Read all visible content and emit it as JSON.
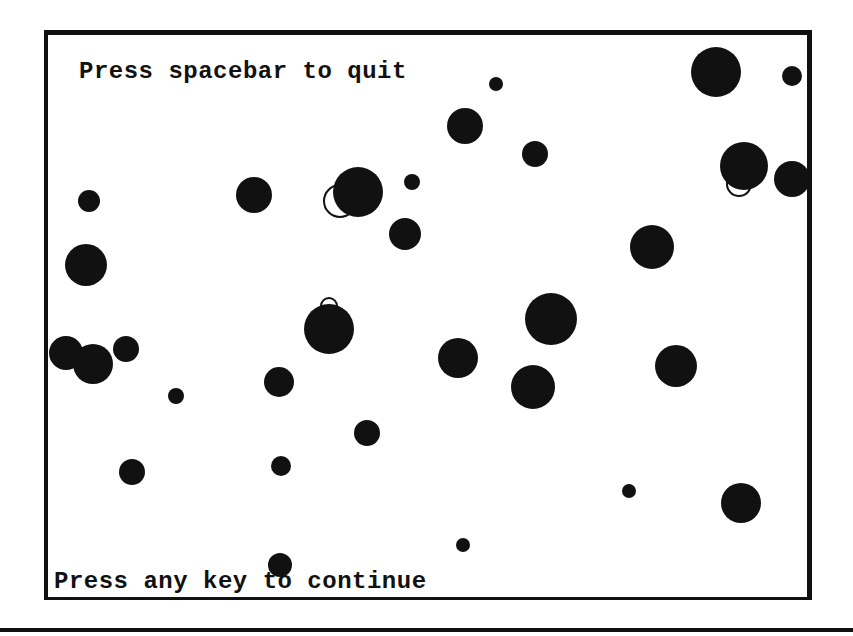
{
  "screen": {
    "quit_prompt": "Press spacebar to quit",
    "continue_prompt": "Press any key to continue"
  },
  "colors": {
    "background": "#ffffff",
    "foreground": "#111111"
  },
  "balls": [
    {
      "x": 716,
      "y": 72,
      "r": 25,
      "style": "solid"
    },
    {
      "x": 792,
      "y": 76,
      "r": 10,
      "style": "solid"
    },
    {
      "x": 496,
      "y": 84,
      "r": 7,
      "style": "solid"
    },
    {
      "x": 465,
      "y": 126,
      "r": 18,
      "style": "solid"
    },
    {
      "x": 535,
      "y": 154,
      "r": 13,
      "style": "solid"
    },
    {
      "x": 744,
      "y": 166,
      "r": 24,
      "style": "solid"
    },
    {
      "x": 739,
      "y": 184,
      "r": 13,
      "style": "hollow"
    },
    {
      "x": 792,
      "y": 179,
      "r": 18,
      "style": "solid"
    },
    {
      "x": 412,
      "y": 182,
      "r": 8,
      "style": "solid"
    },
    {
      "x": 358,
      "y": 192,
      "r": 25,
      "style": "solid"
    },
    {
      "x": 340,
      "y": 201,
      "r": 17,
      "style": "hollow"
    },
    {
      "x": 254,
      "y": 195,
      "r": 18,
      "style": "solid"
    },
    {
      "x": 89,
      "y": 201,
      "r": 11,
      "style": "solid"
    },
    {
      "x": 405,
      "y": 234,
      "r": 16,
      "style": "solid"
    },
    {
      "x": 652,
      "y": 247,
      "r": 22,
      "style": "solid"
    },
    {
      "x": 86,
      "y": 265,
      "r": 21,
      "style": "solid"
    },
    {
      "x": 329,
      "y": 329,
      "r": 25,
      "style": "solid"
    },
    {
      "x": 329,
      "y": 306,
      "r": 9,
      "style": "hollow"
    },
    {
      "x": 551,
      "y": 319,
      "r": 26,
      "style": "solid"
    },
    {
      "x": 66,
      "y": 353,
      "r": 17,
      "style": "solid"
    },
    {
      "x": 93,
      "y": 364,
      "r": 20,
      "style": "solid"
    },
    {
      "x": 126,
      "y": 349,
      "r": 13,
      "style": "solid"
    },
    {
      "x": 458,
      "y": 358,
      "r": 20,
      "style": "solid"
    },
    {
      "x": 676,
      "y": 366,
      "r": 21,
      "style": "solid"
    },
    {
      "x": 533,
      "y": 387,
      "r": 22,
      "style": "solid"
    },
    {
      "x": 279,
      "y": 382,
      "r": 15,
      "style": "solid"
    },
    {
      "x": 176,
      "y": 396,
      "r": 8,
      "style": "solid"
    },
    {
      "x": 367,
      "y": 433,
      "r": 13,
      "style": "solid"
    },
    {
      "x": 281,
      "y": 466,
      "r": 10,
      "style": "solid"
    },
    {
      "x": 132,
      "y": 472,
      "r": 13,
      "style": "solid"
    },
    {
      "x": 629,
      "y": 491,
      "r": 7,
      "style": "solid"
    },
    {
      "x": 741,
      "y": 503,
      "r": 20,
      "style": "solid"
    },
    {
      "x": 463,
      "y": 545,
      "r": 7,
      "style": "solid"
    },
    {
      "x": 280,
      "y": 565,
      "r": 12,
      "style": "solid"
    }
  ]
}
